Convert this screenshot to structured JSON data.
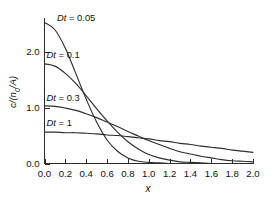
{
  "chart_data": {
    "type": "line",
    "title": "",
    "subtitle": "",
    "xlabel": "x",
    "ylabel": "c/(n0/A)",
    "ylabel_display": "c/(n₀/A)",
    "xlim": [
      0.0,
      2.0
    ],
    "ylim": [
      0.0,
      2.6
    ],
    "grid": false,
    "legend_position": "inline-annotations",
    "xticks": [
      "0.0",
      "0.2",
      "0.4",
      "0.6",
      "0.8",
      "1.0",
      "1.2",
      "1.4",
      "1.6",
      "1.8",
      "2.0"
    ],
    "xtick_values": [
      0.0,
      0.2,
      0.4,
      0.6,
      0.8,
      1.0,
      1.2,
      1.4,
      1.6,
      1.8,
      2.0
    ],
    "yticks": [
      "0.0",
      "1.0",
      "2.0"
    ],
    "ytick_values": [
      0.0,
      1.0,
      2.0
    ],
    "x": [
      0.0,
      0.1,
      0.2,
      0.3,
      0.4,
      0.5,
      0.6,
      0.7,
      0.8,
      0.9,
      1.0,
      1.1,
      1.2,
      1.3,
      1.4,
      1.5,
      1.6,
      1.7,
      1.8,
      1.9,
      2.0
    ],
    "series": [
      {
        "name": "Dt = 0.05",
        "label": "Dt = 0.05",
        "param_symbol": "Dt",
        "param_value": "0.05",
        "color": "#2f2f2f",
        "values": [
          2.52,
          2.39,
          2.06,
          1.61,
          1.15,
          0.74,
          0.42,
          0.22,
          0.1,
          0.04,
          0.02,
          0.01,
          0.0,
          0.0,
          0.0,
          0.0,
          0.0,
          0.0,
          0.0,
          0.0,
          0.0
        ]
      },
      {
        "name": "Dt = 0.1",
        "label": "Dt = 0.1",
        "param_symbol": "Dt",
        "param_value": "0.1",
        "color": "#2f2f2f",
        "values": [
          1.78,
          1.74,
          1.61,
          1.43,
          1.21,
          0.98,
          0.76,
          0.56,
          0.39,
          0.26,
          0.16,
          0.1,
          0.06,
          0.03,
          0.02,
          0.01,
          0.0,
          0.0,
          0.0,
          0.0,
          0.0
        ]
      },
      {
        "name": "Dt = 0.3",
        "label": "Dt = 0.3",
        "param_symbol": "Dt",
        "param_value": "0.3",
        "color": "#2f2f2f",
        "values": [
          1.03,
          1.02,
          0.99,
          0.95,
          0.89,
          0.82,
          0.74,
          0.66,
          0.57,
          0.49,
          0.41,
          0.34,
          0.27,
          0.21,
          0.17,
          0.13,
          0.1,
          0.07,
          0.05,
          0.04,
          0.03
        ]
      },
      {
        "name": "Dt = 1",
        "label": "Dt = 1",
        "param_symbol": "Dt",
        "param_value": "1",
        "color": "#2f2f2f",
        "values": [
          0.56,
          0.56,
          0.55,
          0.55,
          0.54,
          0.53,
          0.51,
          0.5,
          0.48,
          0.46,
          0.44,
          0.41,
          0.39,
          0.36,
          0.34,
          0.31,
          0.29,
          0.27,
          0.24,
          0.22,
          0.2
        ]
      }
    ],
    "annotations": [
      {
        "text": "Dt = 0.05",
        "x": 0.12,
        "y": 2.62
      },
      {
        "text": "Dt = 0.1",
        "x": 0.02,
        "y": 1.95
      },
      {
        "text": "Dt = 0.3",
        "x": 0.02,
        "y": 1.18
      },
      {
        "text": "Dt = 1",
        "x": 0.02,
        "y": 0.72
      }
    ]
  }
}
